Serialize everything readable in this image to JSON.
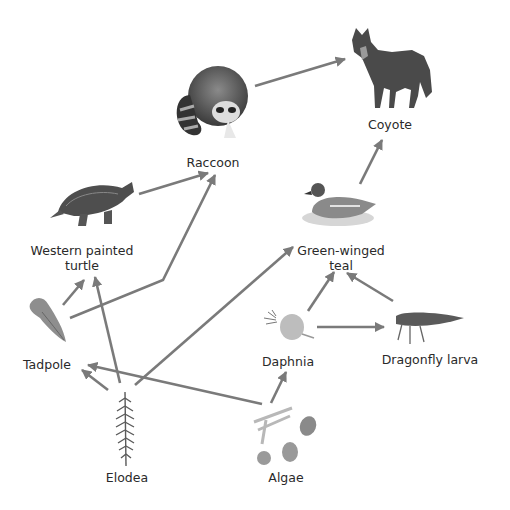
{
  "diagram": {
    "type": "food-web",
    "arrow_color": "#7a7a7a",
    "nodes": [
      {
        "id": "coyote",
        "label": "Coyote",
        "x": 390,
        "y": 125
      },
      {
        "id": "raccoon",
        "label": "Raccoon",
        "x": 213,
        "y": 162
      },
      {
        "id": "turtle",
        "label": "Western painted\nturtle",
        "label_line1": "Western painted",
        "label_line2": "turtle",
        "x": 82,
        "y": 250
      },
      {
        "id": "teal",
        "label": "Green-winged\nteal",
        "label_line1": "Green-winged",
        "label_line2": "teal",
        "x": 341,
        "y": 250
      },
      {
        "id": "tadpole",
        "label": "Tadpole",
        "x": 47,
        "y": 365
      },
      {
        "id": "daphnia",
        "label": "Daphnia",
        "x": 288,
        "y": 362
      },
      {
        "id": "dragonfly",
        "label": "Dragonfly larva",
        "x": 430,
        "y": 360
      },
      {
        "id": "elodea",
        "label": "Elodea",
        "x": 127,
        "y": 477
      },
      {
        "id": "algae",
        "label": "Algae",
        "x": 286,
        "y": 477
      }
    ],
    "edges": [
      {
        "from": "raccoon",
        "to": "coyote"
      },
      {
        "from": "teal",
        "to": "coyote"
      },
      {
        "from": "turtle",
        "to": "raccoon"
      },
      {
        "from": "tadpole",
        "to": "raccoon"
      },
      {
        "from": "tadpole",
        "to": "turtle"
      },
      {
        "from": "elodea",
        "to": "turtle"
      },
      {
        "from": "elodea",
        "to": "tadpole"
      },
      {
        "from": "elodea",
        "to": "teal"
      },
      {
        "from": "algae",
        "to": "tadpole"
      },
      {
        "from": "algae",
        "to": "daphnia"
      },
      {
        "from": "daphnia",
        "to": "teal"
      },
      {
        "from": "daphnia",
        "to": "dragonfly"
      },
      {
        "from": "dragonfly",
        "to": "teal"
      }
    ]
  }
}
